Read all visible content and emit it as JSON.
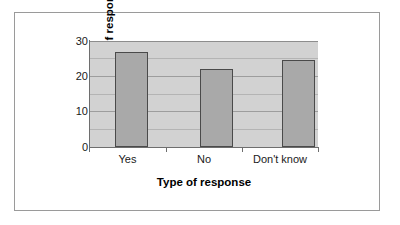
{
  "chart_data": {
    "type": "bar",
    "title": "",
    "categories": [
      "Yes",
      "No",
      "Don't know"
    ],
    "values": [
      27,
      22,
      24.5
    ],
    "xlabel": "Type of response",
    "ylabel": "Number of responses",
    "ylim": [
      0,
      30
    ],
    "ytick_labels": [
      "0",
      "10",
      "20",
      "30"
    ],
    "ytick_values": [
      0,
      10,
      20,
      30
    ],
    "gridline_values": [
      5,
      10,
      15,
      20,
      25,
      30
    ],
    "grid": true,
    "legend": "none",
    "plot_background": "#d2d2d2",
    "bar_fill": "#a9a9a9",
    "bar_edge": "#4a4a4a",
    "axis_color": "#6e6e6e",
    "frame_color": "#9a9a9a"
  }
}
